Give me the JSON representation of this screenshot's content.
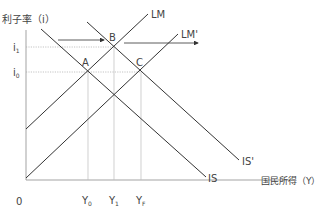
{
  "diagram": {
    "type": "IS-LM",
    "y_axis_label": "利子率（i）",
    "x_axis_label": "国民所得（Y）",
    "origin_label": "0",
    "y_ticks": [
      {
        "label": "i",
        "sub": "1",
        "y": 47
      },
      {
        "label": "i",
        "sub": "0",
        "y": 72
      }
    ],
    "x_ticks": [
      {
        "label": "Y",
        "sub": "0",
        "x": 88
      },
      {
        "label": "Y",
        "sub": "1",
        "x": 114
      },
      {
        "label": "Y",
        "sub": "F",
        "x": 141
      }
    ],
    "curves": [
      {
        "name": "LM",
        "label": "LM"
      },
      {
        "name": "LM-prime",
        "label": "LM'"
      },
      {
        "name": "IS",
        "label": "IS"
      },
      {
        "name": "IS-prime",
        "label": "IS'"
      }
    ],
    "points": [
      {
        "label": "A"
      },
      {
        "label": "B"
      },
      {
        "label": "C"
      }
    ],
    "colors": {
      "line": "#333333",
      "axis": "#999999",
      "guide": "#aaaaaa",
      "text": "#444444"
    }
  }
}
